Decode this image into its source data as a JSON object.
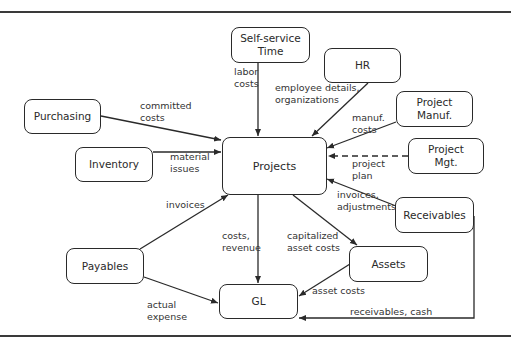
{
  "diagram": {
    "nodes": [
      {
        "id": "self_service_time",
        "label": "Self-service\nTime",
        "x": 231,
        "y": 27,
        "w": 79,
        "h": 36
      },
      {
        "id": "hr",
        "label": "HR",
        "x": 324,
        "y": 48,
        "w": 77,
        "h": 35
      },
      {
        "id": "purchasing",
        "label": "Purchasing",
        "x": 24,
        "y": 99,
        "w": 77,
        "h": 35
      },
      {
        "id": "project_manuf",
        "label": "Project\nManuf.",
        "x": 396,
        "y": 91,
        "w": 77,
        "h": 36
      },
      {
        "id": "inventory",
        "label": "Inventory",
        "x": 75,
        "y": 147,
        "w": 78,
        "h": 35
      },
      {
        "id": "projects",
        "label": "Projects",
        "x": 222,
        "y": 137,
        "w": 105,
        "h": 58
      },
      {
        "id": "project_mgt",
        "label": "Project\nMgt.",
        "x": 408,
        "y": 138,
        "w": 76,
        "h": 36
      },
      {
        "id": "receivables",
        "label": "Receivables",
        "x": 395,
        "y": 197,
        "w": 79,
        "h": 36
      },
      {
        "id": "payables",
        "label": "Payables",
        "x": 66,
        "y": 248,
        "w": 78,
        "h": 36
      },
      {
        "id": "assets",
        "label": "Assets",
        "x": 349,
        "y": 246,
        "w": 79,
        "h": 36
      },
      {
        "id": "gl",
        "label": "GL",
        "x": 219,
        "y": 284,
        "w": 79,
        "h": 35
      }
    ],
    "edge_labels": [
      {
        "id": "labor_costs",
        "text": "labor\ncosts",
        "x": 234,
        "y": 66
      },
      {
        "id": "employee_details",
        "text": "employee details,\norganizations",
        "x": 275,
        "y": 82
      },
      {
        "id": "committed_costs",
        "text": "committed\ncosts",
        "x": 140,
        "y": 100
      },
      {
        "id": "manuf_costs",
        "text": "manuf.\ncosts",
        "x": 352,
        "y": 112
      },
      {
        "id": "material_issues",
        "text": "material\nissues",
        "x": 170,
        "y": 151
      },
      {
        "id": "project_plan",
        "text": "project\nplan",
        "x": 352,
        "y": 158
      },
      {
        "id": "invoices_adjustments",
        "text": "invoices,\nadjustments",
        "x": 337,
        "y": 189
      },
      {
        "id": "invoices",
        "text": "invoices",
        "x": 166,
        "y": 199
      },
      {
        "id": "costs_revenue",
        "text": "costs,\nrevenue",
        "x": 222,
        "y": 230
      },
      {
        "id": "capitalized_asset_costs",
        "text": "capitalized\nasset costs",
        "x": 287,
        "y": 230
      },
      {
        "id": "asset_costs",
        "text": "asset costs",
        "x": 312,
        "y": 285
      },
      {
        "id": "actual_expense",
        "text": "actual\nexpense",
        "x": 147,
        "y": 299
      },
      {
        "id": "receivables_cash",
        "text": "receivables, cash",
        "x": 350,
        "y": 306
      }
    ],
    "edges": [
      {
        "from": "self_service_time",
        "to": "projects",
        "label": "labor costs",
        "style": "solid"
      },
      {
        "from": "hr",
        "to": "projects",
        "label": "employee details, organizations",
        "style": "solid"
      },
      {
        "from": "purchasing",
        "to": "projects",
        "label": "committed costs",
        "style": "solid"
      },
      {
        "from": "project_manuf",
        "to": "projects",
        "label": "manuf. costs",
        "style": "solid"
      },
      {
        "from": "inventory",
        "to": "projects",
        "label": "material issues",
        "style": "solid"
      },
      {
        "from": "project_mgt",
        "to": "projects",
        "label": "project plan",
        "style": "dashed"
      },
      {
        "from": "receivables",
        "to": "projects",
        "label": "invoices, adjustments",
        "style": "solid"
      },
      {
        "from": "payables",
        "to": "projects",
        "label": "invoices",
        "style": "solid"
      },
      {
        "from": "projects",
        "to": "gl",
        "label": "costs, revenue",
        "style": "solid"
      },
      {
        "from": "projects",
        "to": "assets",
        "label": "capitalized asset costs",
        "style": "solid"
      },
      {
        "from": "assets",
        "to": "gl",
        "label": "asset costs",
        "style": "solid"
      },
      {
        "from": "payables",
        "to": "gl",
        "label": "actual expense",
        "style": "solid"
      },
      {
        "from": "receivables",
        "to": "gl",
        "label": "receivables, cash",
        "style": "solid"
      }
    ],
    "colors": {
      "stroke": "#2a2a2a",
      "text": "#2a2a2a",
      "background": "#ffffff"
    }
  }
}
